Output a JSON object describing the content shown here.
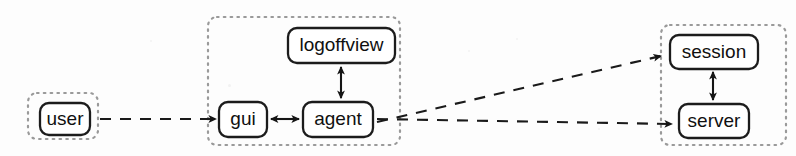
{
  "diagram": {
    "type": "component-collaboration-diagram",
    "background_color": "#fdfdfd",
    "groups": [
      {
        "id": "group-user",
        "name": "user-group",
        "border_color": "#9a9a9a",
        "border_style": "dotted",
        "x": 28,
        "y": 93,
        "w": 70,
        "h": 46
      },
      {
        "id": "group-client",
        "name": "client-group",
        "border_color": "#9a9a9a",
        "border_style": "dotted",
        "x": 208,
        "y": 17,
        "w": 192,
        "h": 128
      },
      {
        "id": "group-backend",
        "name": "backend-group",
        "border_color": "#9a9a9a",
        "border_style": "dotted",
        "x": 661,
        "y": 25,
        "w": 125,
        "h": 120
      }
    ],
    "nodes": [
      {
        "id": "user",
        "label": "user",
        "group": "group-user",
        "x": 40,
        "y": 103,
        "w": 50,
        "h": 32,
        "font_size": 19
      },
      {
        "id": "logoffview",
        "label": "logoffview",
        "group": "group-client",
        "x": 288,
        "y": 28,
        "w": 107,
        "h": 35,
        "font_size": 19
      },
      {
        "id": "gui",
        "label": "gui",
        "group": "group-client",
        "x": 219,
        "y": 102,
        "w": 48,
        "h": 35,
        "font_size": 19
      },
      {
        "id": "agent",
        "label": "agent",
        "group": "group-client",
        "x": 303,
        "y": 102,
        "w": 70,
        "h": 35,
        "font_size": 19
      },
      {
        "id": "session",
        "label": "session",
        "group": "group-backend",
        "x": 670,
        "y": 35,
        "w": 88,
        "h": 34,
        "font_size": 19
      },
      {
        "id": "server",
        "label": "server",
        "group": "group-backend",
        "x": 679,
        "y": 104,
        "w": 70,
        "h": 34,
        "font_size": 19
      }
    ],
    "edges": [
      {
        "id": "edge-user-gui",
        "name": "edge-user-to-gui",
        "from": "user",
        "to": "gui",
        "style": "dashed",
        "arrow": "end",
        "path": "M 100 119 L 216 119"
      },
      {
        "id": "edge-gui-agent",
        "name": "edge-gui-agent",
        "from": "gui",
        "to": "agent",
        "style": "solid",
        "arrow": "both",
        "path": "M 270 119 L 300 119"
      },
      {
        "id": "edge-agent-logoffview",
        "name": "edge-agent-logoffview",
        "from": "agent",
        "to": "logoffview",
        "style": "solid",
        "arrow": "both",
        "path": "M 341 99 L 341 66"
      },
      {
        "id": "edge-agent-session",
        "name": "edge-agent-to-session",
        "from": "agent",
        "to": "session",
        "style": "dashed",
        "arrow": "end",
        "path": "M 377 122 L 663 55"
      },
      {
        "id": "edge-agent-server",
        "name": "edge-agent-to-server",
        "from": "agent",
        "to": "server",
        "style": "dashed",
        "arrow": "end",
        "path": "M 377 119 L 674 124"
      },
      {
        "id": "edge-session-server",
        "name": "edge-session-server",
        "from": "session",
        "to": "server",
        "style": "solid",
        "arrow": "both",
        "path": "M 713 71 L 713 101"
      }
    ]
  }
}
